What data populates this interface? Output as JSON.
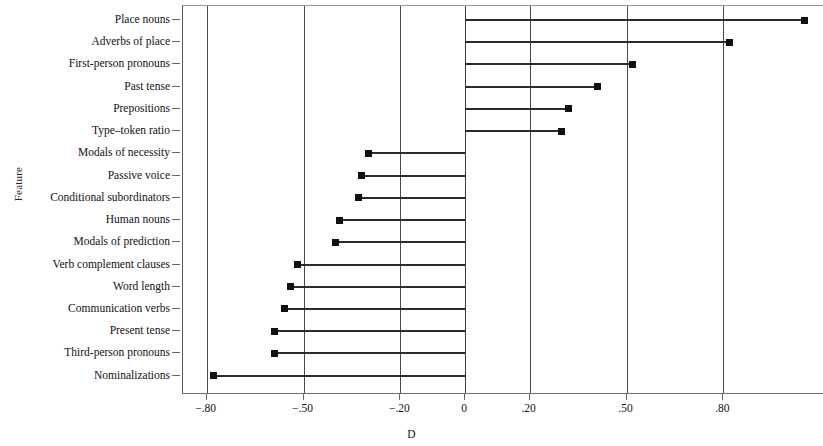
{
  "chart_data": {
    "type": "bar",
    "orientation": "horizontal",
    "style": "lollipop",
    "title": "",
    "xlabel": "D",
    "ylabel": "Feature",
    "xlim": [
      -0.95,
      1.16
    ],
    "ylim": null,
    "grid": true,
    "grid_axis": "x",
    "legend": null,
    "xticks": [
      -0.8,
      -0.5,
      -0.2,
      0,
      0.2,
      0.5,
      0.8
    ],
    "xtick_labels": [
      "−.80",
      "−.50",
      "−.20",
      "0",
      ".20",
      ".50",
      ".80"
    ],
    "categories": [
      "Place nouns",
      "Adverbs of place",
      "First-person pronouns",
      "Past tense",
      "Prepositions",
      "Type–token ratio",
      "Modals of necessity",
      "Passive voice",
      "Conditional subordinators",
      "Human nouns",
      "Modals of prediction",
      "Verb complement clauses",
      "Word length",
      "Communication verbs",
      "Present tense",
      "Third-person pronouns",
      "Nominalizations"
    ],
    "values": [
      1.05,
      0.82,
      0.52,
      0.41,
      0.32,
      0.3,
      -0.3,
      -0.32,
      -0.33,
      -0.39,
      -0.4,
      -0.52,
      -0.54,
      -0.56,
      -0.59,
      -0.59,
      -0.78
    ],
    "marker_color": "#111111",
    "line_color": "#2b2b2b",
    "baseline": 0
  },
  "axes": {
    "x_axis_title": "D",
    "y_axis_title": "Feature"
  }
}
